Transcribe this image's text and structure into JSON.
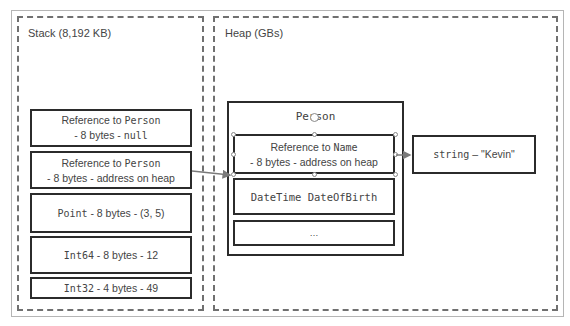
{
  "diagram": {
    "stack": {
      "label": "Stack (8,192 KB)",
      "items": [
        {
          "line1_prefix": "Reference to ",
          "line1_type": "Person",
          "line2_prefix": "- 8 bytes - ",
          "line2_value": "null"
        },
        {
          "line1_prefix": "Reference to ",
          "line1_type": "Person",
          "line2_prefix": "- 8 bytes - address on heap",
          "line2_value": ""
        },
        {
          "type": "Point",
          "text": " - 8 bytes - (3, 5)"
        },
        {
          "type": "Int64",
          "text": " - 8 bytes - 12"
        },
        {
          "type": "Int32",
          "text": " - 4 bytes - 49"
        }
      ]
    },
    "heap": {
      "label": "Heap (GBs)",
      "object": {
        "title": "Person",
        "fields": [
          {
            "line1_prefix": "Reference to ",
            "line1_type": "Name",
            "line2": "- 8 bytes - address on heap"
          },
          {
            "text": "DateTime DateOfBirth"
          },
          {
            "text": "…"
          }
        ]
      },
      "string_object": {
        "type": "string",
        "text": " – \"Kevin\""
      }
    },
    "colors": {
      "border": "#2b2b2b",
      "dash": "#707070",
      "arrow": "#7a7a7a"
    }
  }
}
